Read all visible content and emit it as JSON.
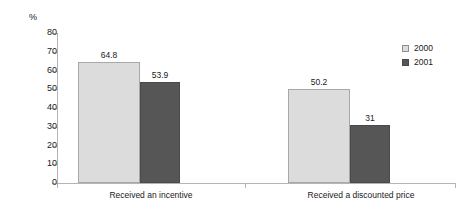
{
  "chart_data": {
    "type": "bar",
    "title": "",
    "subtitle": "",
    "xlabel": "",
    "ylabel": "%",
    "ylim": [
      0,
      80
    ],
    "ytick_labels": [
      "80",
      "70",
      "60",
      "50",
      "40",
      "30",
      "20",
      "10",
      "0"
    ],
    "ytick_values": [
      80,
      70,
      60,
      50,
      40,
      30,
      20,
      10,
      0
    ],
    "grid": false,
    "legend_position": "right",
    "categories": [
      "Received an incentive",
      "Received a discounted price"
    ],
    "series": [
      {
        "name": "2000",
        "color": "#dcdcdc",
        "values": [
          64.8,
          50.2
        ],
        "value_labels": [
          "64.8",
          "50.2"
        ]
      },
      {
        "name": "2001",
        "color": "#565656",
        "values": [
          53.9,
          31
        ],
        "value_labels": [
          "53.9",
          "31"
        ]
      }
    ]
  },
  "axis": {
    "unit_label": "%",
    "line_color": "#b4b4b4"
  },
  "legend": {
    "entries": [
      {
        "label": "2000",
        "swatch": "light"
      },
      {
        "label": "2001",
        "swatch": "dark"
      }
    ]
  }
}
